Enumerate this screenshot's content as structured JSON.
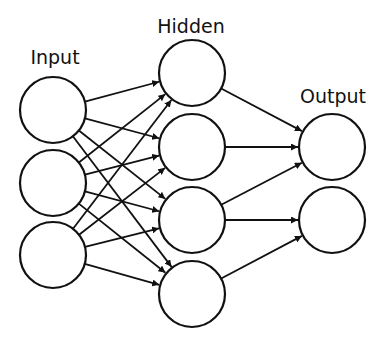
{
  "diagram": {
    "type": "feedforward-neural-network",
    "layers": [
      {
        "name": "input",
        "label": "Input",
        "label_pos": [
          55,
          64
        ],
        "x": 53,
        "nodes_y": [
          110,
          183,
          255
        ]
      },
      {
        "name": "hidden",
        "label": "Hidden",
        "label_pos": [
          191,
          33
        ],
        "x": 192,
        "nodes_y": [
          73,
          147,
          220,
          294
        ]
      },
      {
        "name": "output",
        "label": "Output",
        "label_pos": [
          333,
          103
        ],
        "x": 332,
        "nodes_y": [
          147,
          220
        ]
      }
    ],
    "node_radius": 33,
    "connections": [
      {
        "from": "input",
        "to": "hidden",
        "pattern": "fully-connected"
      },
      {
        "from": "hidden.0",
        "to": "output.0"
      },
      {
        "from": "hidden.1",
        "to": "output.0"
      },
      {
        "from": "hidden.2",
        "to": "output.0"
      },
      {
        "from": "hidden.2",
        "to": "output.1"
      },
      {
        "from": "hidden.3",
        "to": "output.1"
      }
    ],
    "colors": {
      "stroke": "#111111",
      "fill": "#ffffff",
      "background": "#ffffff"
    }
  }
}
